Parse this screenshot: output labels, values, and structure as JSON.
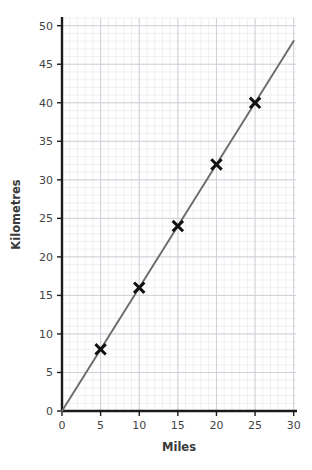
{
  "chart_data": {
    "type": "scatter",
    "title": "",
    "subtitle": "",
    "xlabel": "Miles",
    "ylabel": "Kilometres",
    "xlim": [
      0,
      30.3
    ],
    "ylim": [
      0,
      51
    ],
    "x_ticks": [
      0,
      5,
      10,
      15,
      20,
      25,
      30
    ],
    "x_tick_labels": [
      "0",
      "5",
      "10",
      "15",
      "20",
      "25",
      "30"
    ],
    "y_ticks": [
      0,
      5,
      10,
      15,
      20,
      25,
      30,
      35,
      40,
      45,
      50
    ],
    "y_tick_labels": [
      "0",
      "5",
      "10",
      "15",
      "20",
      "25",
      "30",
      "35",
      "40",
      "45",
      "50"
    ],
    "grid": true,
    "minor_grid": true,
    "minor_grid_step_x": 1,
    "minor_grid_step_y": 1,
    "major_grid_step_x": 5,
    "major_grid_step_y": 5,
    "legend": false,
    "legend_position": "none",
    "x": [
      5,
      10,
      15,
      20,
      25
    ],
    "values": [
      8,
      16,
      24,
      32,
      40
    ],
    "points": [
      {
        "x": 5,
        "y": 8
      },
      {
        "x": 10,
        "y": 16
      },
      {
        "x": 15,
        "y": 24
      },
      {
        "x": 20,
        "y": 32
      },
      {
        "x": 25,
        "y": 40
      }
    ],
    "marker": "x-cross",
    "marker_color": "#111111",
    "series": [
      {
        "name": "Line of best fit",
        "type": "line",
        "slope": 1.6,
        "intercept": 0,
        "from": {
          "x": 0,
          "y": 0
        },
        "to": {
          "x": 30,
          "y": 48
        },
        "color": "#6b6b6b"
      }
    ],
    "annotations": []
  },
  "style": {
    "background": "#ffffff",
    "axis_color": "#1a1a1a",
    "minor_grid_color": "#e9e9ee",
    "major_grid_color": "#d0d0d8",
    "line_color": "#6b6b6b",
    "marker_color": "#111111",
    "tick_label_color": "#444444",
    "axis_title_color": "#3a3a3a"
  },
  "geometry": {
    "plot_left": 62,
    "plot_right": 296,
    "plot_top": 18,
    "plot_bottom": 411
  }
}
